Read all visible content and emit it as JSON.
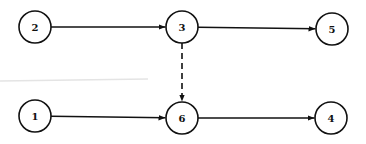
{
  "diagram": {
    "type": "network-graph",
    "nodes": [
      {
        "id": "2",
        "label": "2",
        "x": 35,
        "y": 27
      },
      {
        "id": "3",
        "label": "3",
        "x": 182,
        "y": 27
      },
      {
        "id": "5",
        "label": "5",
        "x": 332,
        "y": 29
      },
      {
        "id": "1",
        "label": "1",
        "x": 35,
        "y": 116
      },
      {
        "id": "6",
        "label": "6",
        "x": 182,
        "y": 118
      },
      {
        "id": "4",
        "label": "4",
        "x": 331,
        "y": 118
      }
    ],
    "edges": [
      {
        "from": "2",
        "to": "3",
        "style": "solid"
      },
      {
        "from": "3",
        "to": "5",
        "style": "solid"
      },
      {
        "from": "3",
        "to": "6",
        "style": "dashed"
      },
      {
        "from": "1",
        "to": "6",
        "style": "solid"
      },
      {
        "from": "6",
        "to": "4",
        "style": "solid"
      }
    ],
    "colors": {
      "stroke": "#111111",
      "background": "#ffffff"
    }
  }
}
